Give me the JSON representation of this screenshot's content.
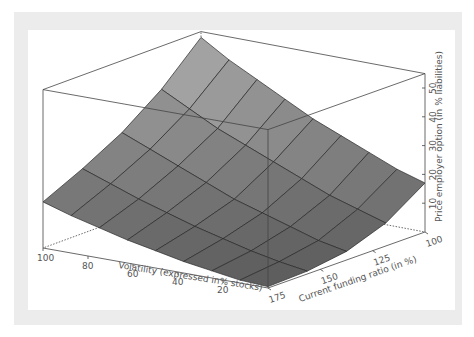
{
  "chart_data": {
    "type": "surface3d",
    "title": "",
    "x_axis": {
      "label": "Volatility (expressed in% stocks)",
      "ticks": [
        100,
        80,
        60,
        40,
        20
      ],
      "range": [
        0,
        100
      ]
    },
    "y_axis": {
      "label": "Current funding ratio (in %)",
      "ticks": [
        175,
        150,
        125,
        100
      ],
      "range": [
        100,
        175
      ]
    },
    "z_axis": {
      "label": "Price employer option (in % liabilities)",
      "ticks": [
        10,
        20,
        30,
        40,
        50
      ],
      "range": [
        0,
        55
      ]
    },
    "grid": {
      "volatility": [
        0,
        12.5,
        25,
        37.5,
        50,
        62.5,
        75,
        87.5,
        100
      ],
      "funding_ratio": [
        100,
        118.75,
        137.5,
        156.25,
        175
      ]
    },
    "values_note": "rows = funding_ratio (100 → 175), columns = volatility (0 → 100)",
    "values": [
      [
        17,
        20,
        24,
        28,
        32,
        37,
        42,
        47,
        53
      ],
      [
        8,
        11,
        14,
        18,
        22,
        26,
        30,
        35,
        40
      ],
      [
        3,
        5,
        8,
        11,
        14,
        18,
        22,
        26,
        30
      ],
      [
        1,
        2.5,
        4.5,
        7,
        9.5,
        12.5,
        15.5,
        19,
        22.5
      ],
      [
        0.5,
        1,
        2.5,
        4,
        6,
        8,
        10.5,
        13,
        16
      ]
    ],
    "colors": {
      "surface_light": "#a8a8a8",
      "surface_dark": "#5c5c5c",
      "mesh": "#2a2a2a",
      "box": "#444444",
      "frame": "#ececec"
    },
    "legend": null
  }
}
